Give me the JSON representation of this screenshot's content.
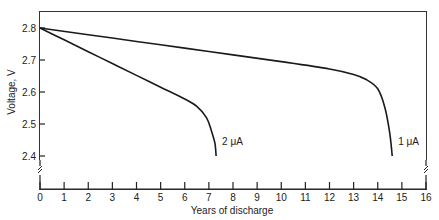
{
  "chart_data": {
    "type": "line",
    "title": "",
    "xlabel": "Years of discharge",
    "ylabel": "Voltage, V",
    "xlim": [
      0,
      16
    ],
    "ylim": [
      2.4,
      2.8
    ],
    "x_ticks": [
      "0",
      "1",
      "2",
      "3",
      "4",
      "5",
      "6",
      "7",
      "8",
      "9",
      "10",
      "11",
      "12",
      "13",
      "14",
      "15",
      "16"
    ],
    "y_ticks": [
      "2.4",
      "2.5",
      "2.6",
      "2.7",
      "2.8"
    ],
    "grid": false,
    "legend": "inline labels",
    "axis_breaks": [
      "y-axis below 2.4",
      "right axis below 2.4"
    ],
    "series": [
      {
        "name": "2 μA",
        "x": [
          0,
          1,
          2,
          3,
          4,
          5,
          6,
          6.5,
          6.9,
          7.1,
          7.25,
          7.3
        ],
        "y": [
          2.8,
          2.763,
          2.726,
          2.689,
          2.652,
          2.615,
          2.578,
          2.555,
          2.52,
          2.48,
          2.44,
          2.4
        ]
      },
      {
        "name": "1 μA",
        "x": [
          0,
          2,
          4,
          6,
          8,
          10,
          12,
          13,
          13.5,
          14.0,
          14.3,
          14.5,
          14.6
        ],
        "y": [
          2.8,
          2.779,
          2.758,
          2.737,
          2.716,
          2.695,
          2.672,
          2.655,
          2.64,
          2.61,
          2.55,
          2.47,
          2.4
        ]
      }
    ]
  },
  "labels": {
    "series_2ua": "2 μA",
    "series_1ua": "1 μA",
    "xlabel": "Years of discharge",
    "ylabel": "Voltage, V"
  }
}
